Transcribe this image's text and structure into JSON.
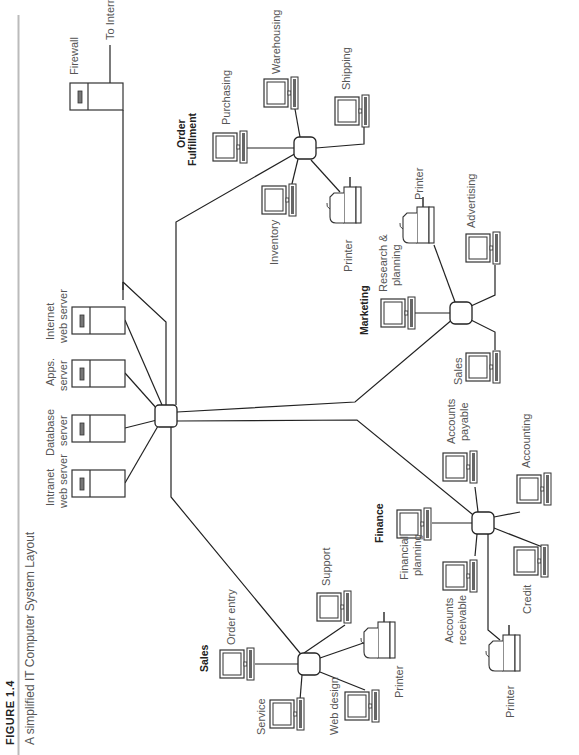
{
  "figure": {
    "number": "FIGURE  1.4",
    "caption": "A simplified IT Computer System Layout"
  },
  "core": {
    "servers": [
      {
        "line1": "Intranet",
        "line2": "web server"
      },
      {
        "line1": "Database",
        "line2": "server"
      },
      {
        "line1": "Apps.",
        "line2": "server"
      },
      {
        "line1": "Internet",
        "line2": "web server"
      }
    ],
    "firewall": "Firewall",
    "to_internet": "To Internet"
  },
  "groups": {
    "order_fulfillment": {
      "title_line1": "Order",
      "title_line2": "Fulfillment",
      "nodes": [
        "Purchasing",
        "Warehousing",
        "Shipping",
        "Inventory",
        "Printer"
      ]
    },
    "marketing": {
      "title": "Marketing",
      "nodes": [
        "Research &",
        "planning",
        "Printer",
        "Advertising",
        "Sales"
      ]
    },
    "finance": {
      "title": "Finance",
      "nodes": [
        "Financial",
        "planning",
        "Accounts",
        "payable",
        "Accounting",
        "Accounts",
        "receivable",
        "Credit",
        "Printer"
      ]
    },
    "sales": {
      "title": "Sales",
      "nodes": [
        "Order entry",
        "Support",
        "Service",
        "Web design",
        "Printer"
      ]
    }
  }
}
